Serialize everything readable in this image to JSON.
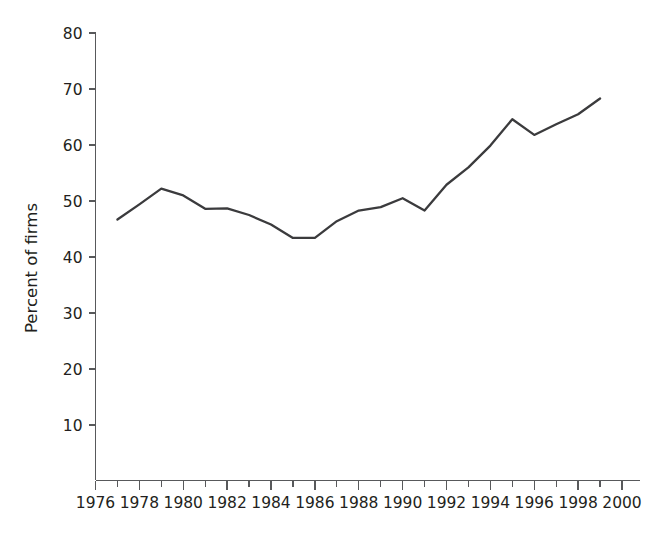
{
  "chart_data": {
    "type": "line",
    "title": "",
    "subtitle": "",
    "xlabel": "",
    "ylabel": "Percent of firms",
    "xlim": [
      1976,
      2000
    ],
    "ylim": [
      0,
      80
    ],
    "grid": false,
    "legend": "none",
    "y_ticks": [
      10,
      20,
      30,
      40,
      50,
      60,
      70,
      80
    ],
    "y_tick_labels": [
      "10",
      "20",
      "30",
      "40",
      "50",
      "60",
      "70",
      "80"
    ],
    "x_ticks": [
      1976,
      1978,
      1980,
      1982,
      1984,
      1986,
      1988,
      1990,
      1992,
      1994,
      1996,
      1998,
      2000
    ],
    "x_tick_labels": [
      "1976",
      "1978",
      "1980",
      "1982",
      "1984",
      "1986",
      "1988",
      "1990",
      "1992",
      "1994",
      "1996",
      "1998",
      "2000"
    ],
    "x_minor_ticks": [
      1977,
      1979,
      1981,
      1983,
      1985,
      1987,
      1989,
      1991,
      1993,
      1995,
      1997,
      1999
    ],
    "series": [
      {
        "name": "Percent of firms",
        "color": "#3b3b3d",
        "x": [
          1977,
          1978,
          1979,
          1980,
          1981,
          1982,
          1983,
          1984,
          1985,
          1986,
          1987,
          1988,
          1989,
          1990,
          1991,
          1992,
          1993,
          1994,
          1995,
          1996,
          1997,
          1998,
          1999
        ],
        "values": [
          46.7,
          49.4,
          52.2,
          51.0,
          48.6,
          48.7,
          47.5,
          45.8,
          43.4,
          43.4,
          46.4,
          48.3,
          48.9,
          50.5,
          48.3,
          52.9,
          56.0,
          59.9,
          64.6,
          61.8,
          63.7,
          65.5,
          68.3
        ]
      }
    ]
  },
  "axis": {
    "y_axis_name": "y-axis",
    "x_axis_name": "x-axis"
  }
}
